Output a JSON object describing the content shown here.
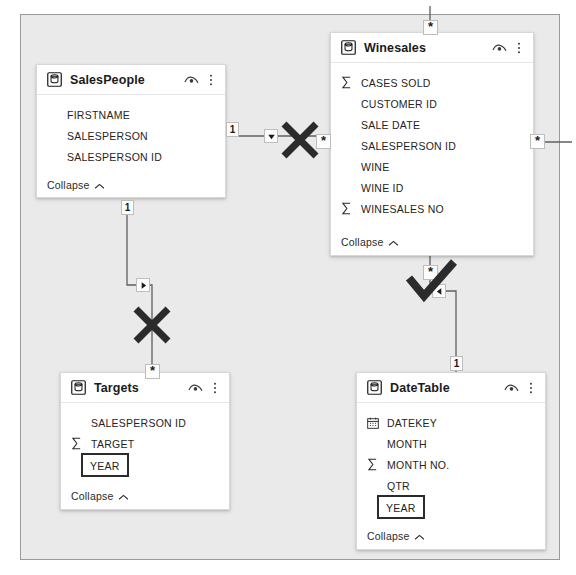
{
  "app": {
    "view_name": "Power BI Model View Diagram",
    "canvas_bg": "#eaeaea",
    "card_bg": "#ffffff",
    "mark_color": "#2b2b2b"
  },
  "tables": [
    {
      "id": "salespeople",
      "name": "SalesPeople",
      "icon": "table-icon",
      "eye_icon": "hide-eye-icon",
      "menu_icon": "more-options-icon",
      "collapse_label": "Collapse",
      "collapse_icon": "chevron-up-icon",
      "fields": [
        {
          "name": "FIRSTNAME",
          "gutter_icon": "",
          "selected": false
        },
        {
          "name": "SALESPERSON",
          "gutter_icon": "",
          "selected": false
        },
        {
          "name": "SALESPERSON ID",
          "gutter_icon": "",
          "selected": false
        }
      ]
    },
    {
      "id": "winesales",
      "name": "Winesales",
      "icon": "table-icon",
      "eye_icon": "hide-eye-icon",
      "menu_icon": "more-options-icon",
      "collapse_label": "Collapse",
      "collapse_icon": "chevron-up-icon",
      "fields": [
        {
          "name": "CASES SOLD",
          "gutter_icon": "sigma-icon",
          "selected": false
        },
        {
          "name": "CUSTOMER ID",
          "gutter_icon": "",
          "selected": false
        },
        {
          "name": "SALE DATE",
          "gutter_icon": "",
          "selected": false
        },
        {
          "name": "SALESPERSON ID",
          "gutter_icon": "",
          "selected": false
        },
        {
          "name": "WINE",
          "gutter_icon": "",
          "selected": false
        },
        {
          "name": "WINE ID",
          "gutter_icon": "",
          "selected": false
        },
        {
          "name": "WINESALES NO",
          "gutter_icon": "sigma-icon",
          "selected": false
        }
      ]
    },
    {
      "id": "targets",
      "name": "Targets",
      "icon": "table-icon",
      "eye_icon": "hide-eye-icon",
      "menu_icon": "more-options-icon",
      "collapse_label": "Collapse",
      "collapse_icon": "chevron-up-icon",
      "fields": [
        {
          "name": "SALESPERSON ID",
          "gutter_icon": "",
          "selected": false
        },
        {
          "name": "TARGET",
          "gutter_icon": "sigma-icon",
          "selected": false
        },
        {
          "name": "YEAR",
          "gutter_icon": "",
          "selected": true
        }
      ]
    },
    {
      "id": "datetable",
      "name": "DateTable",
      "icon": "table-icon",
      "eye_icon": "hide-eye-icon",
      "menu_icon": "more-options-icon",
      "collapse_label": "Collapse",
      "collapse_icon": "chevron-up-icon",
      "fields": [
        {
          "name": "DATEKEY",
          "gutter_icon": "calendar-icon",
          "selected": false
        },
        {
          "name": "MONTH",
          "gutter_icon": "",
          "selected": false
        },
        {
          "name": "MONTH NO.",
          "gutter_icon": "sigma-icon",
          "selected": false
        },
        {
          "name": "QTR",
          "gutter_icon": "",
          "selected": false
        },
        {
          "name": "YEAR",
          "gutter_icon": "",
          "selected": true
        }
      ]
    }
  ],
  "cardinality_badges": [
    {
      "id": "sp-to-ws-one",
      "value": "1"
    },
    {
      "id": "sp-to-ws-many",
      "value": "*"
    },
    {
      "id": "sp-to-tg-one",
      "value": "1"
    },
    {
      "id": "sp-to-tg-many",
      "value": "*"
    },
    {
      "id": "ws-top-many",
      "value": "*"
    },
    {
      "id": "ws-right-many",
      "value": "*"
    },
    {
      "id": "ws-to-dt-many",
      "value": "*"
    },
    {
      "id": "ws-to-dt-one",
      "value": "1"
    }
  ],
  "filter_arrows": [
    {
      "id": "arrow-salespeople-winesales",
      "direction": "down",
      "icon": "triangle-down-icon"
    },
    {
      "id": "arrow-salespeople-targets",
      "direction": "right",
      "icon": "triangle-right-icon"
    },
    {
      "id": "arrow-winesales-datetable",
      "direction": "left",
      "icon": "triangle-left-icon"
    }
  ],
  "annotations": [
    {
      "id": "mark-salespeople-winesales",
      "type": "x",
      "icon": "x-mark-icon",
      "meaning": "relationship crossed out"
    },
    {
      "id": "mark-salespeople-targets",
      "type": "x",
      "icon": "x-mark-icon",
      "meaning": "relationship crossed out"
    },
    {
      "id": "mark-winesales-datetable",
      "type": "check",
      "icon": "check-mark-icon",
      "meaning": "relationship approved"
    }
  ]
}
